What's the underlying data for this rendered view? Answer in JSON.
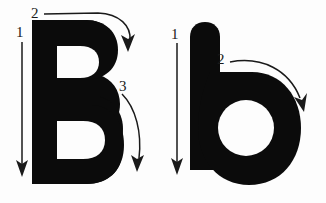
{
  "figure": {
    "background_color": "#fcfcfc",
    "ink_color": "#0b0b0b",
    "arrow_color": "#1a1a1a",
    "counter_color": "#fdfdfd"
  },
  "glyphs": [
    {
      "id": "uppercase-b",
      "character": "B",
      "case": "uppercase",
      "stroke_count": 3,
      "strokes": [
        {
          "number": "1",
          "label_x": 16,
          "label_y": 25,
          "direction": "down",
          "description": "vertical stem, top to bottom"
        },
        {
          "number": "2",
          "label_x": 31,
          "label_y": 8,
          "direction": "clockwise-curve",
          "description": "upper bowl, left to right curving down"
        },
        {
          "number": "3",
          "label_x": 118,
          "label_y": 80,
          "direction": "clockwise-curve",
          "description": "lower bowl, curving down and around"
        }
      ]
    },
    {
      "id": "lowercase-b",
      "character": "b",
      "case": "lowercase",
      "stroke_count": 2,
      "strokes": [
        {
          "number": "1",
          "label_x": 170,
          "label_y": 30,
          "direction": "down",
          "description": "ascender stem, top to bottom"
        },
        {
          "number": "2",
          "label_x": 216,
          "label_y": 53,
          "direction": "clockwise-curve",
          "description": "bowl, left to right curving down"
        }
      ]
    }
  ]
}
